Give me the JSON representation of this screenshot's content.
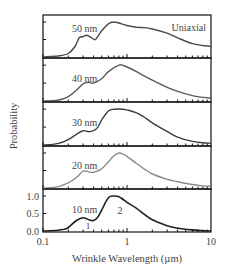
{
  "chart_data": {
    "type": "line",
    "title": "",
    "xlabel": "Wrinkle Wavelength (µm)",
    "ylabel": "Probability",
    "xscale": "log",
    "xlim": [
      0.1,
      10
    ],
    "x_ticks": [
      {
        "value": 0.1,
        "label": "0.1"
      },
      {
        "value": 1,
        "label": "1"
      },
      {
        "value": 10,
        "label": "10"
      }
    ],
    "y_ticks_bottom_panel": [
      {
        "value": 0.0,
        "label": "0.0"
      },
      {
        "value": 0.5,
        "label": "0.5"
      },
      {
        "value": 1.0,
        "label": "1.0"
      }
    ],
    "ylim": [
      0,
      1.2
    ],
    "legend": "none (panel labels)",
    "annotation": "Uniaxial",
    "peak_labels": [
      {
        "text": "1",
        "x": 0.3,
        "panel": "10 nm"
      },
      {
        "text": "2",
        "x": 0.95,
        "panel": "10 nm"
      }
    ],
    "panels": [
      {
        "name": "50 nm",
        "color": "#4a4a4a",
        "x": [
          0.1,
          0.15,
          0.2,
          0.24,
          0.27,
          0.3,
          0.33,
          0.38,
          0.42,
          0.5,
          0.6,
          0.7,
          0.8,
          1.0,
          1.3,
          1.6,
          2.0,
          3.0,
          4.0,
          6.0,
          8.0,
          10.0
        ],
        "y": [
          0.0,
          0.03,
          0.1,
          0.3,
          0.55,
          0.58,
          0.62,
          0.55,
          0.5,
          0.75,
          0.95,
          1.0,
          0.97,
          0.9,
          0.85,
          0.84,
          0.8,
          0.68,
          0.55,
          0.38,
          0.33,
          0.3
        ]
      },
      {
        "name": "40 nm",
        "color": "#5a5a5a",
        "x": [
          0.1,
          0.15,
          0.2,
          0.25,
          0.3,
          0.35,
          0.4,
          0.5,
          0.6,
          0.8,
          0.9,
          1.0,
          1.3,
          1.6,
          2.0,
          3.0,
          4.0,
          6.0,
          8.0,
          10.0
        ],
        "y": [
          0.0,
          0.02,
          0.12,
          0.3,
          0.48,
          0.52,
          0.5,
          0.62,
          0.82,
          1.0,
          0.99,
          0.95,
          0.82,
          0.7,
          0.58,
          0.38,
          0.27,
          0.15,
          0.1,
          0.08
        ]
      },
      {
        "name": "30 nm",
        "color": "#3c3c3c",
        "x": [
          0.1,
          0.15,
          0.2,
          0.25,
          0.3,
          0.35,
          0.4,
          0.45,
          0.5,
          0.6,
          0.7,
          0.9,
          1.0,
          1.3,
          1.6,
          2.0,
          3.0,
          4.0,
          6.0,
          8.0,
          10.0
        ],
        "y": [
          0.0,
          0.04,
          0.15,
          0.3,
          0.4,
          0.37,
          0.4,
          0.5,
          0.7,
          0.95,
          1.0,
          1.0,
          0.98,
          0.9,
          0.78,
          0.62,
          0.38,
          0.22,
          0.1,
          0.06,
          0.05
        ]
      },
      {
        "name": "20 nm",
        "color": "#8a8a8a",
        "x": [
          0.1,
          0.15,
          0.2,
          0.25,
          0.3,
          0.35,
          0.4,
          0.5,
          0.6,
          0.7,
          0.8,
          0.9,
          1.0,
          1.3,
          1.6,
          2.0,
          3.0,
          4.0,
          6.0,
          8.0,
          10.0
        ],
        "y": [
          0.0,
          0.03,
          0.15,
          0.3,
          0.48,
          0.46,
          0.45,
          0.55,
          0.75,
          0.92,
          1.0,
          0.97,
          0.9,
          0.7,
          0.55,
          0.4,
          0.25,
          0.18,
          0.1,
          0.06,
          0.05
        ]
      },
      {
        "name": "10 nm",
        "color": "#1e1e1e",
        "x": [
          0.1,
          0.15,
          0.18,
          0.2,
          0.25,
          0.3,
          0.35,
          0.4,
          0.45,
          0.5,
          0.6,
          0.7,
          0.8,
          0.9,
          1.0,
          1.3,
          1.6,
          2.0,
          3.0,
          4.0,
          6.0,
          8.0,
          10.0
        ],
        "y": [
          0.0,
          0.02,
          0.05,
          0.1,
          0.3,
          0.38,
          0.32,
          0.3,
          0.4,
          0.6,
          0.95,
          1.0,
          0.98,
          0.9,
          0.82,
          0.65,
          0.48,
          0.32,
          0.15,
          0.08,
          0.03,
          0.01,
          0.0
        ]
      }
    ]
  },
  "labels": {
    "ylabel": "Probability",
    "xlabel": "Wrinkle Wavelength (µm)",
    "annotation": "Uniaxial",
    "peak1": "1",
    "peak2": "2",
    "xtick_0": "0.1",
    "xtick_1": "1",
    "xtick_2": "10",
    "ytick_0": "0.0",
    "ytick_1": "0.5",
    "ytick_2": "1.0",
    "panel_0": "50 nm",
    "panel_1": "40 nm",
    "panel_2": "30 nm",
    "panel_3": "20 nm",
    "panel_4": "10 nm"
  }
}
